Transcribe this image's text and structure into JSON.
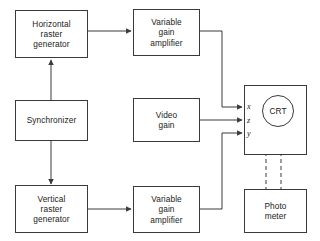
{
  "diagram": {
    "stroke_color": "#3a3a3a",
    "text_color": "#1a1a1a",
    "background": "#ffffff",
    "nodes": [
      {
        "id": "horizontal-raster-generator",
        "label": "Horizontal\nraster\ngenerator"
      },
      {
        "id": "variable-gain-amplifier-top",
        "label": "Variable\ngain\namplifier"
      },
      {
        "id": "synchronizer",
        "label": "Synchronizer"
      },
      {
        "id": "video-gain",
        "label": "Video\ngain"
      },
      {
        "id": "vertical-raster-generator",
        "label": "Vertical\nraster\ngenerator"
      },
      {
        "id": "variable-gain-amplifier-bottom",
        "label": "Variable\ngain\namplifier"
      },
      {
        "id": "photo-meter",
        "label": "Photo\nmeter"
      }
    ],
    "crt": {
      "label": "CRT",
      "ports": [
        {
          "id": "port-x",
          "label": "x"
        },
        {
          "id": "port-z",
          "label": "z"
        },
        {
          "id": "port-y",
          "label": "y"
        }
      ]
    },
    "connections": [
      {
        "id": "horizontal-to-amplifier-top",
        "from": "horizontal-raster-generator",
        "to": "variable-gain-amplifier-top",
        "style": "solid-arrow"
      },
      {
        "id": "amplifier-top-to-crt-x",
        "from": "variable-gain-amplifier-top",
        "to": "port-x",
        "style": "solid-arrow"
      },
      {
        "id": "synchronizer-to-horizontal",
        "from": "synchronizer",
        "to": "horizontal-raster-generator",
        "style": "solid-arrow"
      },
      {
        "id": "synchronizer-to-vertical",
        "from": "synchronizer",
        "to": "vertical-raster-generator",
        "style": "solid-arrow"
      },
      {
        "id": "video-gain-to-crt-z",
        "from": "video-gain",
        "to": "port-z",
        "style": "solid-arrow"
      },
      {
        "id": "vertical-to-amplifier-bottom",
        "from": "vertical-raster-generator",
        "to": "variable-gain-amplifier-bottom",
        "style": "solid-arrow"
      },
      {
        "id": "amplifier-bottom-to-crt-y",
        "from": "variable-gain-amplifier-bottom",
        "to": "port-y",
        "style": "solid-arrow"
      },
      {
        "id": "crt-to-photo-meter-left",
        "from": "crt",
        "to": "photo-meter",
        "style": "dashed"
      },
      {
        "id": "crt-to-photo-meter-right",
        "from": "crt",
        "to": "photo-meter",
        "style": "dashed"
      }
    ]
  }
}
